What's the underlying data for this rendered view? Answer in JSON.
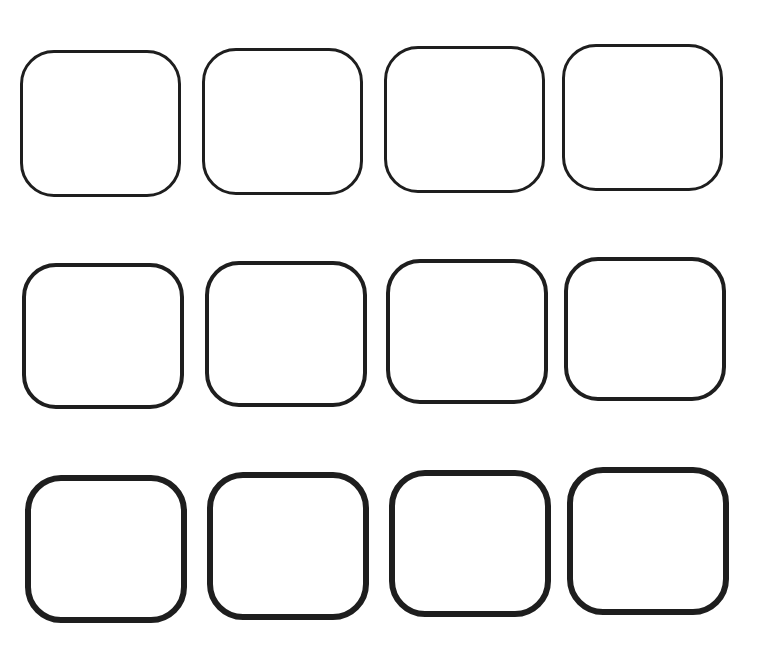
{
  "figure": {
    "rows": 3,
    "columns": 4,
    "box_count": 12,
    "outline_color": "#1e1e1e",
    "fill_color": "#ffffff",
    "background_color": "#ffffff",
    "row_stroke_weight_order": [
      "thin",
      "medium",
      "thick"
    ],
    "boxes": [
      [
        {
          "label": ""
        },
        {
          "label": ""
        },
        {
          "label": ""
        },
        {
          "label": ""
        }
      ],
      [
        {
          "label": ""
        },
        {
          "label": ""
        },
        {
          "label": ""
        },
        {
          "label": ""
        }
      ],
      [
        {
          "label": ""
        },
        {
          "label": ""
        },
        {
          "label": ""
        },
        {
          "label": ""
        }
      ]
    ]
  }
}
